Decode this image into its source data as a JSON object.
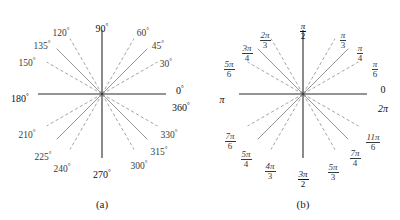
{
  "figure": {
    "width": 400,
    "height": 220,
    "background": "#ffffff",
    "axis_color": "#2b2b2b",
    "solid_ray_color": "#8a8a8a",
    "dashed_ray_color": "#9a9a9a",
    "label_color": "#3a3a3a",
    "axis_label_color": "#111111"
  },
  "chart_data": {
    "type": "scatter",
    "xlabel": "",
    "ylabel": "",
    "grid": false,
    "legend": null,
    "panels": [
      {
        "id": "a",
        "caption": "(a)",
        "units": "degrees",
        "center": [
          102,
          94
        ],
        "radius": 64,
        "axis_angles_deg": [
          0,
          90,
          180,
          270
        ],
        "solid_ray_angles_deg": [
          45,
          135,
          225,
          315
        ],
        "dashed_ray_angles_deg": [
          30,
          60,
          120,
          150,
          210,
          240,
          300,
          330
        ],
        "labels": [
          {
            "text": "90",
            "unit": "deg",
            "angle": 90
          },
          {
            "text": "60",
            "unit": "deg",
            "angle": 60
          },
          {
            "text": "45",
            "unit": "deg",
            "angle": 45
          },
          {
            "text": "30",
            "unit": "deg",
            "angle": 30
          },
          {
            "text": "0",
            "unit": "deg",
            "angle": 0
          },
          {
            "text": "360",
            "unit": "deg",
            "angle": 0
          },
          {
            "text": "330",
            "unit": "deg",
            "angle": 330
          },
          {
            "text": "315",
            "unit": "deg",
            "angle": 315
          },
          {
            "text": "300",
            "unit": "deg",
            "angle": 300
          },
          {
            "text": "270",
            "unit": "deg",
            "angle": 270
          },
          {
            "text": "240",
            "unit": "deg",
            "angle": 240
          },
          {
            "text": "225",
            "unit": "deg",
            "angle": 225
          },
          {
            "text": "210",
            "unit": "deg",
            "angle": 210
          },
          {
            "text": "180",
            "unit": "deg",
            "angle": 180
          },
          {
            "text": "150",
            "unit": "deg",
            "angle": 150
          },
          {
            "text": "135",
            "unit": "deg",
            "angle": 135
          },
          {
            "text": "120",
            "unit": "deg",
            "angle": 120
          }
        ]
      },
      {
        "id": "b",
        "caption": "(b)",
        "units": "radians",
        "center": [
          103,
          94
        ],
        "radius": 64,
        "axis_angles_deg": [
          0,
          90,
          180,
          270
        ],
        "solid_ray_angles_deg": [
          45,
          135,
          225,
          315
        ],
        "dashed_ray_angles_deg": [
          30,
          60,
          120,
          150,
          210,
          240,
          300,
          330
        ],
        "labels": [
          {
            "num": "π",
            "den": "2",
            "angle": 90
          },
          {
            "num": "π",
            "den": "3",
            "angle": 60
          },
          {
            "num": "π",
            "den": "4",
            "angle": 45
          },
          {
            "num": "π",
            "den": "6",
            "angle": 30
          },
          {
            "whole": "0",
            "angle": 0
          },
          {
            "whole": "2π",
            "angle": 0
          },
          {
            "num": "11π",
            "den": "6",
            "angle": 330
          },
          {
            "num": "7π",
            "den": "4",
            "angle": 315
          },
          {
            "num": "5π",
            "den": "3",
            "angle": 300
          },
          {
            "num": "3π",
            "den": "2",
            "angle": 270
          },
          {
            "num": "4π",
            "den": "3",
            "angle": 240
          },
          {
            "num": "5π",
            "den": "4",
            "angle": 225
          },
          {
            "num": "7π",
            "den": "6",
            "angle": 210
          },
          {
            "whole": "π",
            "angle": 180
          },
          {
            "num": "5π",
            "den": "6",
            "angle": 150
          },
          {
            "num": "3π",
            "den": "4",
            "angle": 135
          },
          {
            "num": "2π",
            "den": "3",
            "angle": 120
          }
        ]
      }
    ]
  },
  "panel_a": {
    "caption": "(a)",
    "labels": {
      "d90": "90",
      "d60": "60",
      "d45": "45",
      "d30": "30",
      "d0": "0",
      "d360": "360",
      "d330": "330",
      "d315": "315",
      "d300": "300",
      "d270": "270",
      "d240": "240",
      "d225": "225",
      "d210": "210",
      "d180": "180",
      "d150": "150",
      "d135": "135",
      "d120": "120"
    }
  },
  "panel_b": {
    "caption": "(b)",
    "labels": {
      "pi_over_2": {
        "num": "π",
        "den": "2"
      },
      "pi_over_3": {
        "num": "π",
        "den": "3"
      },
      "pi_over_4": {
        "num": "π",
        "den": "4"
      },
      "pi_over_6": {
        "num": "π",
        "den": "6"
      },
      "zero": "0",
      "two_pi": "2π",
      "eleven_pi_over_6": {
        "num": "11π",
        "den": "6"
      },
      "seven_pi_over_4": {
        "num": "7π",
        "den": "4"
      },
      "five_pi_over_3": {
        "num": "5π",
        "den": "3"
      },
      "three_pi_over_2": {
        "num": "3π",
        "den": "2"
      },
      "four_pi_over_3": {
        "num": "4π",
        "den": "3"
      },
      "five_pi_over_4": {
        "num": "5π",
        "den": "4"
      },
      "seven_pi_over_6": {
        "num": "7π",
        "den": "6"
      },
      "pi": "π",
      "five_pi_over_6": {
        "num": "5π",
        "den": "6"
      },
      "three_pi_over_4": {
        "num": "3π",
        "den": "4"
      },
      "two_pi_over_3": {
        "num": "2π",
        "den": "3"
      }
    }
  }
}
